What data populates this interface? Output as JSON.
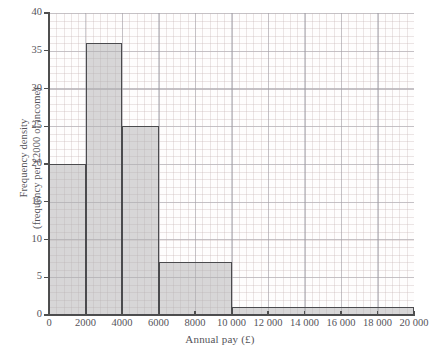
{
  "chart_data": {
    "type": "bar",
    "subtype": "histogram",
    "title": "",
    "xlabel": "Annual pay (£)",
    "ylabel_line1": "Frequency density",
    "ylabel_line2": "(frequency per £2000 of income)",
    "xlim": [
      0,
      20000
    ],
    "ylim": [
      0,
      40
    ],
    "grid": true,
    "legend": null,
    "x_tick_labels": [
      "0",
      "2000",
      "4000",
      "6000",
      "8000",
      "10 000",
      "12 000",
      "14 000",
      "16 000",
      "18 000",
      "20 000"
    ],
    "x_tick_values": [
      0,
      2000,
      4000,
      6000,
      8000,
      10000,
      12000,
      14000,
      16000,
      18000,
      20000
    ],
    "y_tick_labels": [
      "0",
      "5",
      "10",
      "15",
      "20",
      "25",
      "30",
      "35",
      "40"
    ],
    "y_tick_values": [
      0,
      5,
      10,
      15,
      20,
      25,
      30,
      35,
      40
    ],
    "bins": [
      {
        "label": "0–2000",
        "x_start": 0,
        "x_end": 2000,
        "value": 20
      },
      {
        "label": "2000–4000",
        "x_start": 2000,
        "x_end": 4000,
        "value": 36
      },
      {
        "label": "4000–6000",
        "x_start": 4000,
        "x_end": 6000,
        "value": 25
      },
      {
        "label": "6000–10 000",
        "x_start": 6000,
        "x_end": 10000,
        "value": 7
      },
      {
        "label": "10 000–20 000",
        "x_start": 10000,
        "x_end": 20000,
        "value": 1
      }
    ],
    "colors": {
      "bar_fill": "#b0b0b2",
      "bar_edge": "#4b4b4e",
      "grid_major": "#96969f",
      "grid_minor": "#c4b2b2",
      "axis": "#4f4f4f",
      "text": "#55535a",
      "background": "#ffffff"
    }
  }
}
